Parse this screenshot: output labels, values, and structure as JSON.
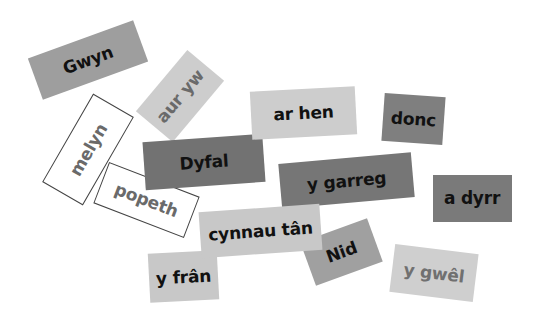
{
  "cards": [
    {
      "id": "nid",
      "label": "Nid",
      "cx": 341,
      "cy": 252,
      "w": 71,
      "h": 46,
      "rot": -20,
      "bg": "#a0a0a0",
      "fg": "#111111",
      "outline": false,
      "z": 1
    },
    {
      "id": "gwyn",
      "label": "Gwyn",
      "cx": 88,
      "cy": 60,
      "w": 112,
      "h": 44,
      "rot": -20,
      "bg": "#9e9e9e",
      "fg": "#111111",
      "outline": false,
      "z": 2
    },
    {
      "id": "aur-yw",
      "label": "aur yw",
      "cx": 180,
      "cy": 96,
      "w": 80,
      "h": 48,
      "rot": -50,
      "bg": "#cdcdcd",
      "fg": "#6a6a6a",
      "outline": false,
      "z": 2
    },
    {
      "id": "melyn",
      "label": "melyn",
      "cx": 88,
      "cy": 149,
      "w": 102,
      "h": 47,
      "rot": -60,
      "bg": "#ffffff",
      "fg": "#6a6a6a",
      "outline": true,
      "z": 2
    },
    {
      "id": "popeth",
      "label": "popeth",
      "cx": 146,
      "cy": 200,
      "w": 97,
      "h": 44,
      "rot": 21,
      "bg": "#ffffff",
      "fg": "#6a6a6a",
      "outline": true,
      "z": 3
    },
    {
      "id": "dyfal",
      "label": "Dyfal",
      "cx": 204,
      "cy": 162,
      "w": 120,
      "h": 48,
      "rot": -4,
      "bg": "#727272",
      "fg": "#111111",
      "outline": false,
      "z": 4
    },
    {
      "id": "ar-hen",
      "label": "ar hen",
      "cx": 303,
      "cy": 113,
      "w": 105,
      "h": 48,
      "rot": -3,
      "bg": "#cdcdcd",
      "fg": "#111111",
      "outline": false,
      "z": 5
    },
    {
      "id": "donc",
      "label": "donc",
      "cx": 413,
      "cy": 119,
      "w": 61,
      "h": 48,
      "rot": 4,
      "bg": "#7f7f7f",
      "fg": "#111111",
      "outline": false,
      "z": 5
    },
    {
      "id": "y-garreg",
      "label": "y garreg",
      "cx": 346,
      "cy": 180,
      "w": 133,
      "h": 45,
      "rot": -5,
      "bg": "#767676",
      "fg": "#111111",
      "outline": false,
      "z": 5
    },
    {
      "id": "a-dyrr",
      "label": "a dyrr",
      "cx": 472,
      "cy": 198,
      "w": 79,
      "h": 47,
      "rot": 0,
      "bg": "#7a7a7a",
      "fg": "#111111",
      "outline": false,
      "z": 5
    },
    {
      "id": "y-fran",
      "label": "y frân",
      "cx": 183,
      "cy": 276,
      "w": 69,
      "h": 49,
      "rot": -3,
      "bg": "#c8c8c8",
      "fg": "#111111",
      "outline": false,
      "z": 5
    },
    {
      "id": "cynnau-tan",
      "label": "cynnau tân",
      "cx": 260,
      "cy": 231,
      "w": 121,
      "h": 46,
      "rot": -4,
      "bg": "#c8c8c8",
      "fg": "#111111",
      "outline": false,
      "z": 6
    },
    {
      "id": "y-gwel",
      "label": "y gwêl",
      "cx": 434,
      "cy": 273,
      "w": 84,
      "h": 48,
      "rot": 7,
      "bg": "#cfcfcf",
      "fg": "#707070",
      "outline": false,
      "z": 5
    }
  ]
}
